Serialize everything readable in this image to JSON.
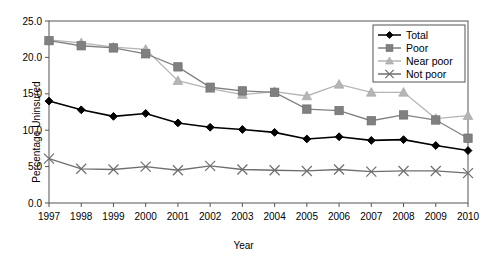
{
  "chart_data": {
    "type": "line",
    "title": "",
    "xlabel": "Year",
    "ylabel": "Percentage Uninsured",
    "categories": [
      1997,
      1998,
      1999,
      2000,
      2001,
      2002,
      2003,
      2004,
      2005,
      2006,
      2007,
      2008,
      2009,
      2010
    ],
    "x": [
      "1997",
      "1998",
      "1999",
      "2000",
      "2001",
      "2002",
      "2003",
      "2004",
      "2005",
      "2006",
      "2007",
      "2008",
      "2009",
      "2010"
    ],
    "xlim": [
      1997,
      2010
    ],
    "ylim": [
      0.0,
      25.0
    ],
    "yticks": [
      "0.0",
      "5.0",
      "10.0",
      "15.0",
      "20.0",
      "25.0"
    ],
    "ytick_values": [
      0.0,
      5.0,
      10.0,
      15.0,
      20.0,
      25.0
    ],
    "grid": false,
    "legend_position": "top-right",
    "series": [
      {
        "name": "Total",
        "marker": "diamond",
        "color": "#000000",
        "values": [
          14.0,
          12.8,
          11.9,
          12.3,
          11.0,
          10.4,
          10.1,
          9.7,
          8.8,
          9.1,
          8.6,
          8.7,
          7.9,
          7.2
        ]
      },
      {
        "name": "Poor",
        "marker": "square",
        "color": "#808080",
        "values": [
          22.3,
          21.6,
          21.3,
          20.5,
          18.7,
          15.9,
          15.4,
          15.2,
          12.9,
          12.7,
          11.3,
          12.1,
          11.4,
          8.9
        ]
      },
      {
        "name": "Near poor",
        "marker": "triangle",
        "color": "#b5b5b5",
        "values": [
          22.4,
          22.0,
          21.4,
          21.1,
          16.8,
          15.7,
          14.9,
          15.3,
          14.7,
          16.3,
          15.2,
          15.2,
          11.6,
          12.0
        ]
      },
      {
        "name": "Not poor",
        "marker": "x",
        "color": "#6e6e6e",
        "values": [
          6.1,
          4.7,
          4.6,
          5.0,
          4.5,
          5.1,
          4.6,
          4.5,
          4.4,
          4.6,
          4.3,
          4.4,
          4.4,
          4.1
        ]
      }
    ]
  },
  "legend": {
    "items": [
      {
        "label": "Total"
      },
      {
        "label": "Poor"
      },
      {
        "label": "Near poor"
      },
      {
        "label": "Not poor"
      }
    ]
  },
  "colors": {
    "total": "#000000",
    "poor": "#808080",
    "near_poor": "#b5b5b5",
    "not_poor": "#6e6e6e",
    "axis": "#555555",
    "frame": "#555555"
  }
}
